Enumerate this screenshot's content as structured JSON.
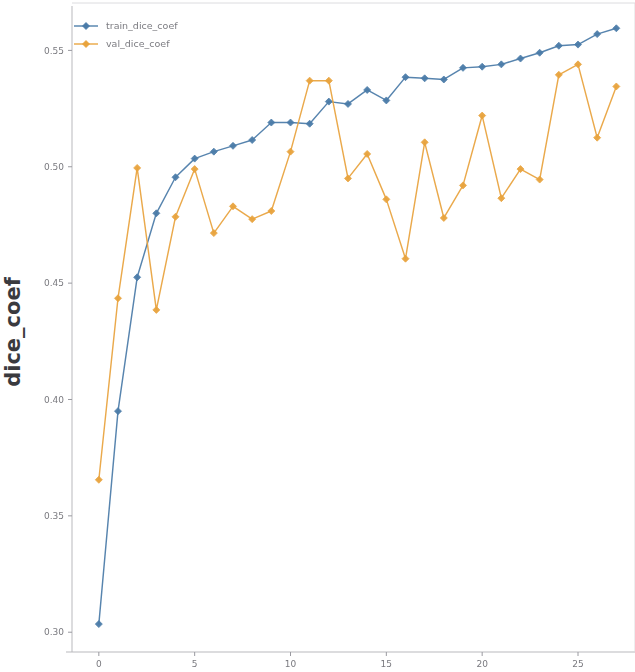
{
  "chart_data": {
    "type": "line",
    "title": "",
    "xlabel": "",
    "ylabel": "dice_coef",
    "xlim": [
      -1.4,
      27.4
    ],
    "ylim": [
      0.2915,
      0.5665
    ],
    "xticks": [
      0,
      5,
      10,
      15,
      20,
      25
    ],
    "xtick_labels": [
      "0",
      "5",
      "10",
      "15",
      "20",
      "25"
    ],
    "yticks": [
      0.3,
      0.35,
      0.4,
      0.45,
      0.5,
      0.55
    ],
    "ytick_labels": [
      "0.30",
      "0.35",
      "0.40",
      "0.45",
      "0.50",
      "0.55"
    ],
    "grid": false,
    "legend_position": "upper left",
    "x": [
      0,
      1,
      2,
      3,
      4,
      5,
      6,
      7,
      8,
      9,
      10,
      11,
      12,
      13,
      14,
      15,
      16,
      17,
      18,
      19,
      20,
      21,
      22,
      23,
      24,
      25,
      26,
      27
    ],
    "series": [
      {
        "name": "train_dice_coef",
        "color": "#4a7ba8",
        "marker": "diamond",
        "values": [
          0.3035,
          0.395,
          0.4525,
          0.48,
          0.4955,
          0.5035,
          0.5065,
          0.509,
          0.5115,
          0.519,
          0.519,
          0.5185,
          0.528,
          0.527,
          0.533,
          0.5285,
          0.5385,
          0.538,
          0.5375,
          0.5425,
          0.543,
          0.544,
          0.5465,
          0.549,
          0.552,
          0.5525,
          0.557,
          0.5595
        ]
      },
      {
        "name": "val_dice_coef",
        "color": "#e8a33d",
        "marker": "diamond",
        "values": [
          0.3655,
          0.4435,
          0.4995,
          0.4385,
          0.4785,
          0.499,
          0.4715,
          0.483,
          0.4775,
          0.481,
          0.5065,
          0.537,
          0.537,
          0.495,
          0.5055,
          0.486,
          0.4605,
          0.5105,
          0.478,
          0.492,
          0.522,
          0.4865,
          0.499,
          0.4945,
          0.5395,
          0.544,
          0.5125,
          0.5345
        ]
      }
    ]
  },
  "legend": {
    "entries": [
      {
        "label": "train_dice_coef"
      },
      {
        "label": "val_dice_coef"
      }
    ]
  },
  "axis": {
    "ylabel": "dice_coef"
  }
}
